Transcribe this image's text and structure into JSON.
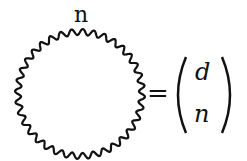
{
  "diagram": {
    "loop_label": "n",
    "equals": "=",
    "binomial": {
      "top": "d",
      "bottom": "n"
    },
    "loop": {
      "type": "wavy-circle",
      "cx": 80,
      "cy": 94,
      "r": 62,
      "waves": 36,
      "amplitude": 3,
      "color": "#111111"
    }
  }
}
